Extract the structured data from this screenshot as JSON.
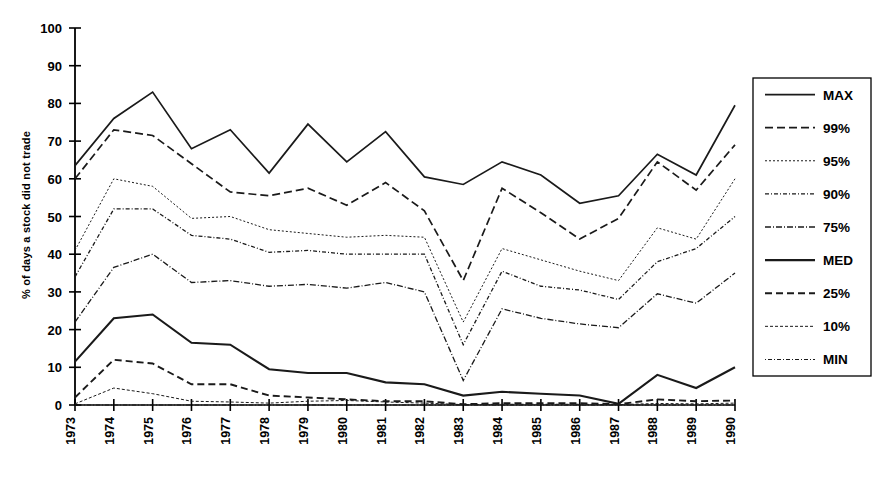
{
  "chart_data": {
    "type": "line",
    "title": "",
    "xlabel": "",
    "ylabel": "% of days a stock did not trade",
    "ylim": [
      0,
      100
    ],
    "ytick_labels": [
      "0",
      "10",
      "20",
      "30",
      "40",
      "50",
      "60",
      "70",
      "80",
      "90",
      "100"
    ],
    "yticks": [
      0,
      10,
      20,
      30,
      40,
      50,
      60,
      70,
      80,
      90,
      100
    ],
    "grid": false,
    "legend_position": "right",
    "categories": [
      "1973",
      "1974",
      "1975",
      "1976",
      "1977",
      "1978",
      "1979",
      "1980",
      "1981",
      "1982",
      "1983",
      "1984",
      "1985",
      "1986",
      "1987",
      "1988",
      "1989",
      "1990"
    ],
    "x": [
      1973,
      1974,
      1975,
      1976,
      1977,
      1978,
      1979,
      1980,
      1981,
      1982,
      1983,
      1984,
      1985,
      1986,
      1987,
      1988,
      1989,
      1990
    ],
    "series": [
      {
        "name": "MAX",
        "values": [
          63.5,
          76.0,
          83.0,
          68.0,
          73.0,
          61.5,
          74.5,
          64.5,
          72.5,
          60.5,
          58.5,
          64.5,
          61.0,
          53.5,
          55.5,
          66.5,
          61.0,
          79.5
        ]
      },
      {
        "name": "99%",
        "values": [
          60.0,
          73.0,
          71.5,
          64.0,
          56.5,
          55.5,
          57.5,
          53.0,
          59.0,
          51.5,
          33.0,
          57.5,
          51.0,
          44.0,
          49.5,
          64.5,
          57.0,
          69.0
        ]
      },
      {
        "name": "95%",
        "values": [
          41.0,
          60.0,
          58.0,
          49.5,
          50.0,
          46.5,
          45.5,
          44.5,
          45.0,
          44.5,
          22.0,
          41.5,
          38.5,
          35.5,
          33.0,
          47.0,
          44.0,
          60.0
        ]
      },
      {
        "name": "90%",
        "values": [
          34.0,
          52.0,
          52.0,
          45.0,
          44.0,
          40.5,
          41.0,
          40.0,
          40.0,
          40.0,
          16.0,
          35.5,
          31.5,
          30.5,
          28.0,
          38.0,
          41.5,
          50.0
        ]
      },
      {
        "name": "75%",
        "values": [
          22.0,
          36.5,
          40.0,
          32.5,
          33.0,
          31.5,
          32.0,
          31.0,
          32.5,
          30.0,
          6.5,
          25.5,
          23.0,
          21.5,
          20.5,
          29.5,
          27.0,
          35.0
        ]
      },
      {
        "name": "MED",
        "values": [
          11.5,
          23.0,
          24.0,
          16.5,
          16.0,
          9.5,
          8.5,
          8.5,
          6.0,
          5.5,
          2.5,
          3.5,
          3.0,
          2.5,
          0.3,
          8.0,
          4.5,
          10.0
        ]
      },
      {
        "name": "25%",
        "values": [
          2.0,
          12.0,
          11.0,
          5.5,
          5.5,
          2.5,
          2.0,
          1.5,
          1.0,
          1.0,
          0.2,
          0.5,
          0.5,
          0.5,
          0.2,
          1.5,
          1.0,
          1.2
        ]
      },
      {
        "name": "10%",
        "values": [
          0.3,
          4.5,
          3.0,
          1.0,
          0.8,
          0.5,
          1.0,
          1.2,
          0.8,
          0.5,
          0.1,
          0.2,
          0.2,
          0.2,
          0.1,
          0.4,
          0.3,
          0.5
        ]
      },
      {
        "name": "MIN",
        "values": [
          0.0,
          0.0,
          0.0,
          0.0,
          0.0,
          0.0,
          0.0,
          0.0,
          0.0,
          0.0,
          0.0,
          0.0,
          0.0,
          0.0,
          0.0,
          0.0,
          0.0,
          0.0
        ]
      }
    ]
  },
  "legend": {
    "entries": [
      {
        "label": "MAX"
      },
      {
        "label": "99%"
      },
      {
        "label": "95%"
      },
      {
        "label": "90%"
      },
      {
        "label": "75%"
      },
      {
        "label": "MED"
      },
      {
        "label": "25%"
      },
      {
        "label": "10%"
      },
      {
        "label": "MIN"
      }
    ]
  },
  "style": {
    "ink": "#1a1a1a",
    "background": "#ffffff",
    "series_strokes": [
      {
        "name": "MAX",
        "width": 1.7,
        "dash": "none"
      },
      {
        "name": "99%",
        "width": 1.7,
        "dash": "8,4"
      },
      {
        "name": "95%",
        "width": 1.0,
        "dash": "2,2"
      },
      {
        "name": "90%",
        "width": 1.3,
        "dash": "4,2,1,2"
      },
      {
        "name": "75%",
        "width": 1.3,
        "dash": "6,2,1,2"
      },
      {
        "name": "MED",
        "width": 2.1,
        "dash": "none"
      },
      {
        "name": "25%",
        "width": 1.9,
        "dash": "7,4"
      },
      {
        "name": "10%",
        "width": 1.0,
        "dash": "3,2"
      },
      {
        "name": "MIN",
        "width": 1.1,
        "dash": "1,2,4,2"
      }
    ]
  }
}
